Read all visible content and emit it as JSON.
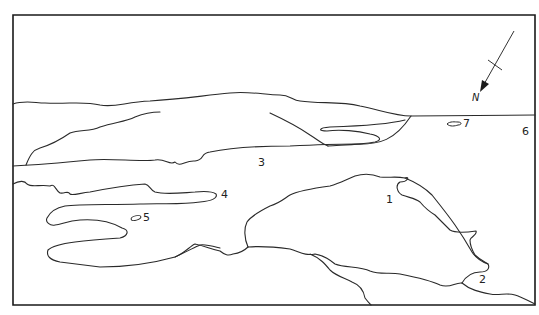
{
  "map": {
    "type": "sketch map",
    "colors": {
      "line": "#2a2a2a",
      "background": "#ffffff"
    },
    "north_arrow": {
      "label": "N",
      "direction": "south-west (down-left)"
    },
    "labels": [
      {
        "id": "1",
        "text": "1",
        "x": 386,
        "y": 199
      },
      {
        "id": "2",
        "text": "2",
        "x": 479,
        "y": 274
      },
      {
        "id": "3",
        "text": "3",
        "x": 258,
        "y": 158
      },
      {
        "id": "4",
        "text": "4",
        "x": 221,
        "y": 190
      },
      {
        "id": "5",
        "text": "5",
        "x": 143,
        "y": 213
      },
      {
        "id": "6",
        "text": "6",
        "x": 522,
        "y": 126
      },
      {
        "id": "7",
        "text": "7",
        "x": 463,
        "y": 118
      }
    ]
  }
}
